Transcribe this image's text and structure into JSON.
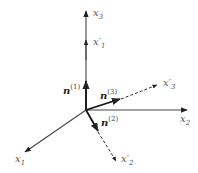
{
  "diagram": {
    "type": "3d-coordinate-axes",
    "colors": {
      "axis": "#333333",
      "vector": "#111111",
      "label": "#555555"
    },
    "origin": {
      "x": 86,
      "y": 110
    },
    "axes": [
      {
        "id": "x1",
        "label": "x",
        "subscript": "1",
        "to": {
          "x": 24,
          "y": 153
        }
      },
      {
        "id": "x2",
        "label": "x",
        "subscript": "2",
        "to": {
          "x": 187,
          "y": 110
        }
      },
      {
        "id": "x3",
        "label": "x",
        "subscript": "3",
        "to": {
          "x": 86,
          "y": 10
        }
      }
    ],
    "rotated_axes": [
      {
        "id": "x1p",
        "label": "x′",
        "subscript": "1",
        "style": "solid",
        "to": {
          "x": 86,
          "y": 39
        }
      },
      {
        "id": "x2p",
        "label": "x′",
        "subscript": "2",
        "style": "dashed",
        "to": {
          "x": 117,
          "y": 162
        }
      },
      {
        "id": "x3p",
        "label": "x′",
        "subscript": "3",
        "style": "dashed",
        "to": {
          "x": 158,
          "y": 84
        }
      }
    ],
    "vectors": [
      {
        "id": "n1",
        "label": "n",
        "superscript": "(1)",
        "to": {
          "x": 86,
          "y": 80
        }
      },
      {
        "id": "n2",
        "label": "n",
        "superscript": "(2)",
        "to": {
          "x": 98,
          "y": 132
        }
      },
      {
        "id": "n3",
        "label": "n",
        "superscript": "(3)",
        "to": {
          "x": 121,
          "y": 99
        }
      }
    ]
  }
}
